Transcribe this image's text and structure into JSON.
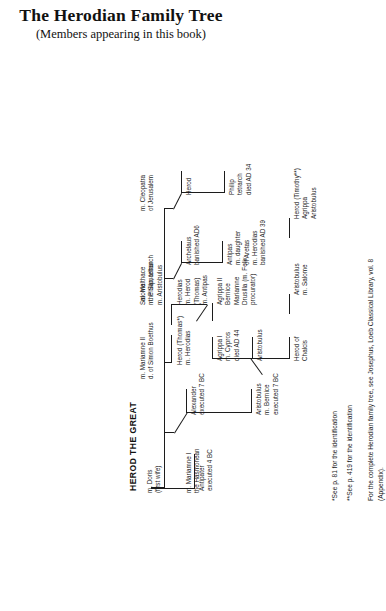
{
  "title": {
    "heading": "The Herodian Family Tree",
    "subheading": "(Members appearing in this book)"
  },
  "patriarch": {
    "label": "HEROD THE GREAT"
  },
  "marriages": [
    {
      "id": "doris",
      "label": "m. Doris\n(first wife)"
    },
    {
      "id": "mariamne1",
      "label": "m. Mariamne I\nthe Hasmonean"
    },
    {
      "id": "mariamne2",
      "label": "m. Mariamne II\nd. of Simon Boethus"
    },
    {
      "id": "malthace",
      "label": "m. Malthace\nthe Samaritan"
    },
    {
      "id": "cleopatra",
      "label": "m. Cleopatra\nof Jerusalem"
    }
  ],
  "children": [
    {
      "id": "antipater",
      "label": "Antipater\nexecuted 4 BC"
    },
    {
      "id": "alexander",
      "label": "Alexander\nexecuted 7 BC"
    },
    {
      "id": "aristobulus",
      "label": "Aristobulus\nm. Bernice\nexecuted 7 BC"
    },
    {
      "id": "herod-thomas",
      "label": "Herod (Thomas*)\nm. Herodias"
    },
    {
      "id": "antipas",
      "label": "Antipas\nm. daughter\nof Aretas\nm. Herodias\nbanished AD 39"
    },
    {
      "id": "archelaus",
      "label": "Archelaus\nbanished AD6"
    },
    {
      "id": "herod-c",
      "label": "Herod"
    },
    {
      "id": "philip",
      "label": "Philip\ntetrarch\ndied AD 34"
    }
  ],
  "grandchildren": [
    {
      "id": "herod-chalcis",
      "label": "Herod of\nChalcis"
    },
    {
      "id": "aristobulus-2",
      "label": "Aristobulus"
    },
    {
      "id": "agrippa1",
      "label": "Agrippa I\nm. Cypros\ndied AD 44"
    },
    {
      "id": "herodias",
      "label": "Herodias\nm. Herod\n(Thomas)\nm. Antipas"
    },
    {
      "id": "salome",
      "label": "Salome\nm. Philip, tetrarch\nm. Aristobulus"
    }
  ],
  "great_grandchildren": [
    {
      "id": "aristobulus-salome",
      "label": "Aristobulus\nm. Salome"
    },
    {
      "id": "agrippa2",
      "label": "Agrippa II\nBernice\nMariamne\nDrusilla (m. Felix procurator)"
    }
  ],
  "great_great_grandchildren": [
    {
      "id": "herod-timothy",
      "label": "Herod (Timothy**)\nAgrippa\nAristobulus"
    }
  ],
  "notes": [
    {
      "id": "note-1",
      "text": "*See p. 81 for the identification"
    },
    {
      "id": "note-2",
      "text": "**See p. 419 for the identification"
    },
    {
      "id": "note-3",
      "text": "For the complete Herodian family tree, see Josephus, Loeb Classical Library, vol. 8\n(Appendix)."
    }
  ],
  "colors": {
    "ink": "#1a1a1a",
    "line": "#1c1c1c",
    "paper": "#ffffff"
  }
}
